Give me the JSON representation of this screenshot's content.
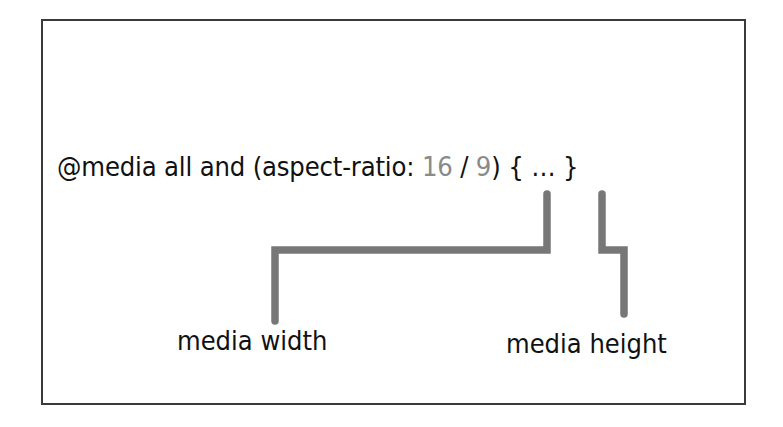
{
  "diagram": {
    "code": {
      "prefix": "@media all and (aspect-ratio: ",
      "width_value": "16",
      "separator": " / ",
      "height_value": "9",
      "suffix": ") { … }"
    },
    "labels": {
      "width": "media width",
      "height": "media height"
    },
    "colors": {
      "text": "#111111",
      "value": "#8a8a8a",
      "connector": "#777777",
      "frame": "#3a3a3a"
    }
  }
}
